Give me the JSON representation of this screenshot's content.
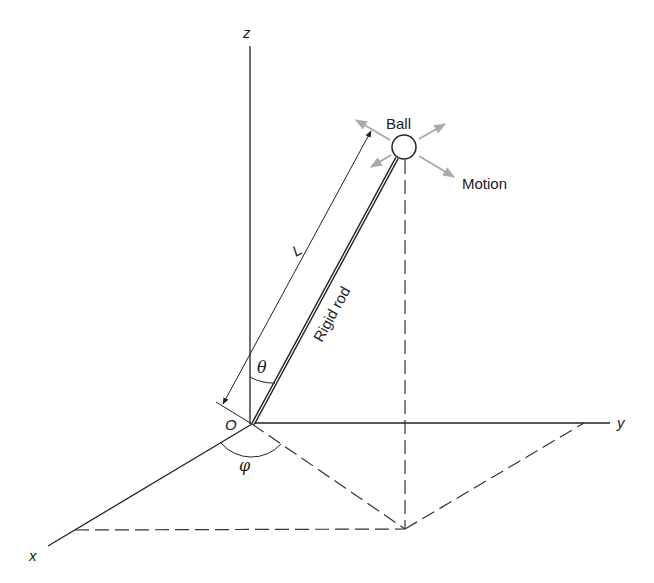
{
  "diagram": {
    "axes": {
      "z_label": "z",
      "y_label": "y",
      "x_label": "x",
      "origin_label": "O"
    },
    "labels": {
      "ball": "Ball",
      "motion": "Motion",
      "rod": "Rigid rod",
      "length": "L",
      "theta": "θ",
      "phi": "φ"
    },
    "colors": {
      "line": "#222222",
      "motion_arrows": "#aaaaaa",
      "background": "#ffffff"
    }
  }
}
